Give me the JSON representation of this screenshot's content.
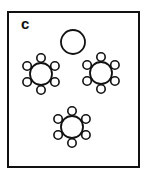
{
  "figure": {
    "panel_label": "c",
    "stroke_color": "#111111",
    "background": "#ffffff",
    "lone_circle": {
      "cx": 73,
      "cy": 42,
      "r": 12
    },
    "tables": [
      {
        "name": "table-cluster-left",
        "cx": 41,
        "cy": 74,
        "r": 11,
        "seats": 6,
        "seat_r": 4.2,
        "seat_dist": 16
      },
      {
        "name": "table-cluster-right",
        "cx": 101,
        "cy": 73,
        "r": 11,
        "seats": 6,
        "seat_r": 4.2,
        "seat_dist": 16
      },
      {
        "name": "table-cluster-bottom",
        "cx": 72,
        "cy": 127,
        "r": 11,
        "seats": 6,
        "seat_r": 4.2,
        "seat_dist": 16
      }
    ]
  }
}
